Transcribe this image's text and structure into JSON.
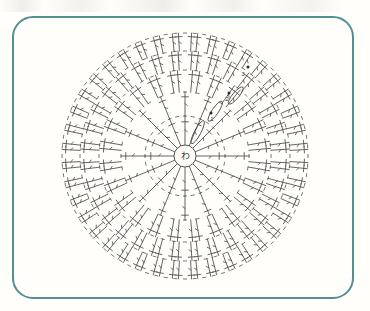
{
  "document": {
    "type": "crochet-chart",
    "title": "Circular crochet motif chart",
    "background_color": "#fffefb"
  },
  "frame": {
    "name": "rounded-frame",
    "border_color": "#53918f",
    "border_width": 2,
    "corner_radius": 21,
    "x": 12,
    "y": 16,
    "width": 342,
    "height": 283
  },
  "chart": {
    "name": "circular-crochet-diagram",
    "center_x": 185,
    "center_y": 156,
    "outer_radius": 123,
    "stroke_color": "#4a4a4a",
    "center_ring": {
      "label": "わ",
      "meaning": "magic-ring",
      "radius": 11
    },
    "rounds": [
      {
        "index": 1,
        "label": "1",
        "r_inner": 11,
        "r_outer": 40,
        "stitches": 16,
        "style": "single"
      },
      {
        "index": 2,
        "label": "2",
        "r_inner": 40,
        "r_outer": 64,
        "stitches": 16,
        "style": "single"
      },
      {
        "index": 3,
        "label": "3",
        "r_inner": 64,
        "r_outer": 86,
        "stitches": 24,
        "style": "vee"
      },
      {
        "index": 4,
        "label": "4",
        "r_inner": 86,
        "r_outer": 105,
        "stitches": 32,
        "style": "vee"
      },
      {
        "index": 5,
        "label": "5",
        "r_inner": 105,
        "r_outer": 123,
        "stitches": 40,
        "style": "vee"
      }
    ],
    "round_markers": [
      {
        "label": "1",
        "x": 212,
        "y": 121
      },
      {
        "label": "2",
        "x": 227,
        "y": 101
      },
      {
        "label": "3",
        "x": 243,
        "y": 76
      }
    ],
    "start_dots": [
      {
        "x": 211,
        "y": 113
      },
      {
        "x": 229,
        "y": 93
      },
      {
        "x": 248,
        "y": 67
      }
    ],
    "turning_chains": [
      {
        "from_r": 14,
        "to_r": 40,
        "angle_deg": -62
      },
      {
        "from_r": 42,
        "to_r": 66,
        "angle_deg": -56
      },
      {
        "from_r": 68,
        "to_r": 90,
        "angle_deg": -50
      }
    ]
  }
}
